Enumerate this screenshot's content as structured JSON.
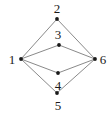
{
  "figure": {
    "width": 112,
    "height": 116,
    "background_color": "#ffffff",
    "edge_color": "#6b6b6b",
    "node_color": "#1a1a1a",
    "label_color": "#1a1a1a",
    "edge_width": 0.8,
    "node_radius": 1.9
  },
  "graph_data": {
    "type": "graph",
    "directed": false,
    "node_count": 6,
    "edge_count": 8,
    "nodes": [
      {
        "id": "1",
        "label": "1",
        "x": 21,
        "y": 59,
        "label_x": 12,
        "label_y": 59,
        "label_position": "left",
        "degree": 4
      },
      {
        "id": "2",
        "label": "2",
        "x": 57,
        "y": 19,
        "label_x": 57,
        "label_y": 8,
        "label_position": "above",
        "degree": 2
      },
      {
        "id": "3",
        "label": "3",
        "x": 59,
        "y": 45,
        "label_x": 58,
        "label_y": 34,
        "label_position": "above",
        "degree": 2
      },
      {
        "id": "4",
        "label": "4",
        "x": 58,
        "y": 73,
        "label_x": 58,
        "label_y": 85,
        "label_position": "below",
        "degree": 2
      },
      {
        "id": "5",
        "label": "5",
        "x": 57,
        "y": 93,
        "label_x": 58,
        "label_y": 105,
        "label_position": "below",
        "degree": 2
      },
      {
        "id": "6",
        "label": "6",
        "x": 95,
        "y": 59,
        "label_x": 103,
        "label_y": 59,
        "label_position": "right",
        "degree": 4
      }
    ],
    "edges": [
      {
        "source": "1",
        "target": "2"
      },
      {
        "source": "1",
        "target": "3"
      },
      {
        "source": "1",
        "target": "4"
      },
      {
        "source": "1",
        "target": "5"
      },
      {
        "source": "2",
        "target": "6"
      },
      {
        "source": "3",
        "target": "6"
      },
      {
        "source": "4",
        "target": "6"
      },
      {
        "source": "5",
        "target": "6"
      }
    ]
  }
}
